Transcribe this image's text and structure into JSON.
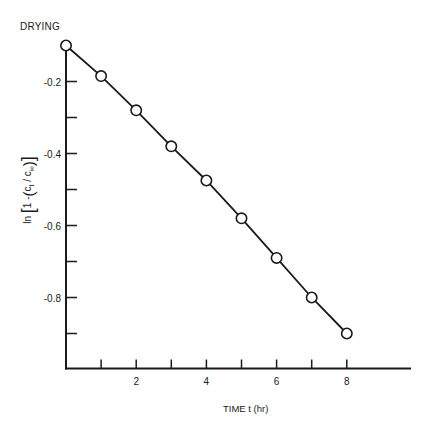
{
  "chart_data": {
    "type": "line",
    "title": "DRYING",
    "xlabel": "TIME t (hr)",
    "ylabel": "ln [1 - (c_t / c_∞)]",
    "ylabel_parts": {
      "ln": "ln",
      "one_minus": "1 -",
      "ct": "c",
      "ct_sub": "t",
      "slash": "/",
      "cinf": "c",
      "cinf_sub": "∞"
    },
    "x": [
      0,
      1,
      2,
      3,
      4,
      5,
      6,
      7,
      8
    ],
    "series": [
      {
        "name": "DRYING",
        "marker": "open-circle",
        "line": "solid",
        "values": [
          -0.1,
          -0.185,
          -0.28,
          -0.38,
          -0.475,
          -0.58,
          -0.69,
          -0.8,
          -0.9
        ]
      }
    ],
    "xlim": [
      0,
      10
    ],
    "ylim": [
      -1.0,
      -0.1
    ],
    "x_ticks_major": [
      2,
      4,
      6,
      8
    ],
    "x_ticks_minor": [
      1,
      3,
      5,
      7
    ],
    "x_tick_labels": [
      "2",
      "4",
      "6",
      "8"
    ],
    "y_ticks_major": [
      -0.2,
      -0.4,
      -0.6,
      -0.8
    ],
    "y_ticks_minor": [
      -0.3,
      -0.5,
      -0.7,
      -0.9
    ],
    "y_tick_labels": [
      "-0.2",
      "-0.4",
      "-0.6",
      "-0.8"
    ],
    "grid": false,
    "legend": "none"
  }
}
